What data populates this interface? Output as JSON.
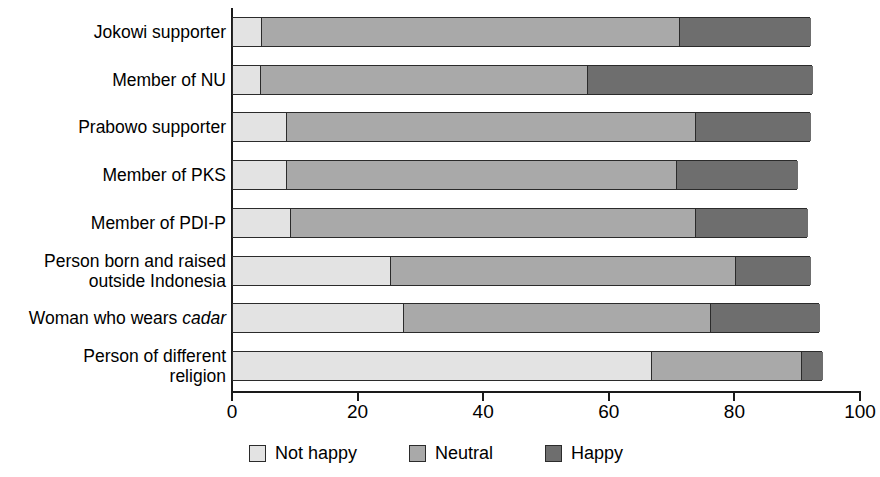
{
  "chart_data": {
    "type": "bar",
    "orientation": "horizontal",
    "stacked": true,
    "title": "",
    "xlabel": "",
    "ylabel": "",
    "xlim": [
      0,
      100
    ],
    "xticks": [
      0,
      20,
      40,
      60,
      80,
      100
    ],
    "xtick_labels": [
      "0",
      "20",
      "40",
      "60",
      "80",
      "100"
    ],
    "grid": false,
    "legend_position": "bottom",
    "categories": [
      "Jokowi supporter",
      "Member of NU",
      "Prabowo supporter",
      "Member of PKS",
      "Member of PDI-P",
      "Person born and raised outside Indonesia",
      "Woman who wears cadar",
      "Person of different religion"
    ],
    "category_lines": [
      [
        "Jokowi supporter"
      ],
      [
        "Member of NU"
      ],
      [
        "Prabowo supporter"
      ],
      [
        "Member of PKS"
      ],
      [
        "Member of PDI-P"
      ],
      [
        "Person born and raised",
        "outside Indonesia"
      ],
      [
        "Woman who wears ",
        "cadar"
      ],
      [
        "Person of different",
        "religion"
      ]
    ],
    "series": [
      {
        "name": "Not happy",
        "color": "#e3e3e3",
        "values": [
          4.5,
          4.3,
          8.5,
          8.5,
          9.0,
          25.0,
          27.0,
          66.5
        ]
      },
      {
        "name": "Neutral",
        "color": "#a9a9a9",
        "values": [
          66.5,
          52.0,
          65.0,
          62.0,
          64.5,
          55.0,
          49.0,
          24.0
        ]
      },
      {
        "name": "Happy",
        "color": "#6e6e6e",
        "values": [
          21.0,
          36.0,
          18.5,
          19.5,
          18.0,
          12.0,
          17.5,
          3.5
        ]
      }
    ],
    "totals": [
      92.0,
      92.3,
      92.0,
      90.0,
      91.5,
      92.0,
      93.5,
      94.0
    ]
  },
  "legend": {
    "items": [
      {
        "label": "Not happy",
        "swatch": "not-happy-swatch",
        "color": "#e3e3e3"
      },
      {
        "label": "Neutral",
        "swatch": "neutral-swatch",
        "color": "#a9a9a9"
      },
      {
        "label": "Happy",
        "swatch": "happy-swatch",
        "color": "#6e6e6e"
      }
    ]
  },
  "axis": {
    "ticks": [
      "0",
      "20",
      "40",
      "60",
      "80",
      "100"
    ]
  }
}
